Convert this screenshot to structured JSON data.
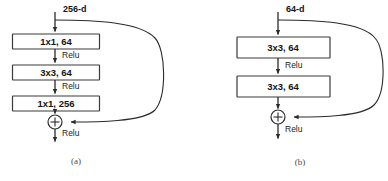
{
  "figure": {
    "background_color": "#ffffff",
    "stroke_color": "#2b2b2b",
    "box_fill_color": "#ffffff",
    "text_color": "#151515"
  },
  "panels": [
    {
      "id": "a",
      "caption": "(a)",
      "input_dim_label": "256-d",
      "blocks": [
        {
          "label": "1x1, 64"
        },
        {
          "label": "3x3, 64"
        },
        {
          "label": "1x1, 256"
        }
      ],
      "activations": [
        {
          "label": "Relu"
        },
        {
          "label": "Relu"
        },
        {
          "label": "Relu"
        }
      ],
      "sum_symbol": "+"
    },
    {
      "id": "b",
      "caption": "(b)",
      "input_dim_label": "64-d",
      "blocks": [
        {
          "label": "3x3, 64"
        },
        {
          "label": "3x3, 64"
        }
      ],
      "activations": [
        {
          "label": "Relu"
        },
        {
          "label": "Relu"
        }
      ],
      "sum_symbol": "+"
    }
  ]
}
